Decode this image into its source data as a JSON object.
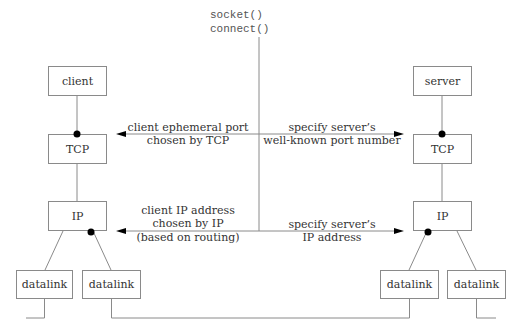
{
  "diagram": {
    "api_calls": [
      "socket()",
      "connect()"
    ],
    "client_side": {
      "app": "client",
      "transport": "TCP",
      "network": "IP",
      "datalinks": [
        "datalink",
        "datalink"
      ]
    },
    "server_side": {
      "app": "server",
      "transport": "TCP",
      "network": "IP",
      "datalinks": [
        "datalink",
        "datalink"
      ]
    },
    "annotations": {
      "tcp_left": [
        "client ephemeral port",
        "chosen by TCP"
      ],
      "tcp_right": [
        "specify server’s",
        "well-known port number"
      ],
      "ip_left": [
        "client IP address",
        "chosen by IP",
        "(based on routing)"
      ],
      "ip_right": [
        "specify server’s",
        "IP address"
      ]
    }
  }
}
